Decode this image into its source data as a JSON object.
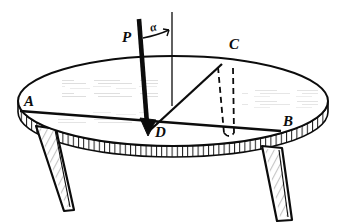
{
  "figure": {
    "background_color": "#ffffff",
    "ink_color": "#0c0c0c",
    "width": 347,
    "height": 224
  },
  "labels": {
    "point_a": "A",
    "point_b": "B",
    "point_c": "C",
    "point_d": "D",
    "force_p": "P",
    "angle_alpha": "α"
  },
  "elements": {
    "tabletop": "elliptical-tabletop",
    "rim": "table-edge-rim",
    "leg_left": "table-leg-left",
    "leg_right": "table-leg-right",
    "chord_ab": "chord-line-a-to-b",
    "chord_dc": "chord-line-d-to-c",
    "vertical_axis": "vertical-reference-line",
    "force_arrow": "force-arrow-p",
    "angle_arc": "angle-arc-alpha",
    "hidden_leg": "dashed-hidden-leg-at-c"
  },
  "geometry": {
    "ellipse_center_x": 173,
    "ellipse_center_y": 101,
    "ellipse_rx": 155,
    "ellipse_ry": 45,
    "center_point": [
      172,
      104
    ],
    "point_a": [
      20,
      111
    ],
    "point_b": [
      281,
      131
    ],
    "point_c": [
      222,
      64
    ],
    "point_d": [
      148,
      131
    ],
    "force_origin": [
      139,
      19
    ],
    "force_tip": [
      148,
      133
    ],
    "vertical_top": [
      172,
      12
    ],
    "angle_degrees": 7
  }
}
